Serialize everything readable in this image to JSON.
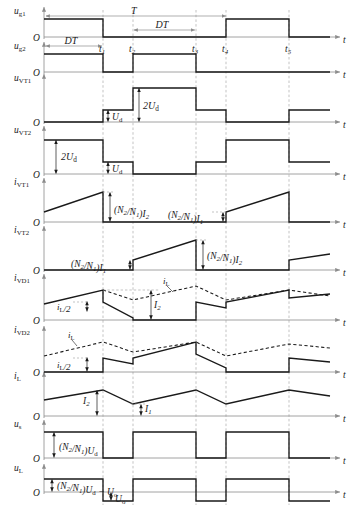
{
  "figure": {
    "type": "timing-waveform-diagram",
    "axis_label_t": "t",
    "origin_label": "O",
    "period_label": "T",
    "duty_label": "DT",
    "time_markers": [
      "t1",
      "t2",
      "t3",
      "t4",
      "t5"
    ],
    "time_marker_text": [
      "t",
      "t",
      "t",
      "t",
      "t"
    ],
    "time_marker_sub": [
      "1",
      "2",
      "3",
      "4",
      "5"
    ]
  },
  "colors": {
    "waveform": "#1a1a1a",
    "axis": "#8c8c8c",
    "dashed_guide": "#9a9a9a",
    "annotation": "#1a1a1a",
    "background": "#ffffff"
  },
  "rows": [
    {
      "id": "u_g1",
      "name": "u-g1",
      "y_label_main": "u",
      "y_label_sub": "g1",
      "annotations": [
        "T",
        "DT"
      ]
    },
    {
      "id": "u_g2",
      "name": "u-g2",
      "y_label_main": "u",
      "y_label_sub": "g2",
      "annotations": [
        "DT"
      ]
    },
    {
      "id": "u_vt1",
      "name": "u-vt1",
      "y_label_main": "u",
      "y_label_sub": "VT1",
      "annotations": [
        "Ud",
        "2Ud"
      ],
      "annotation_text": [
        "U",
        "2U"
      ],
      "annotation_sub": [
        "d",
        "d"
      ]
    },
    {
      "id": "u_vt2",
      "name": "u-vt2",
      "y_label_main": "u",
      "y_label_sub": "VT2",
      "annotations": [
        "2Ud",
        "Ud"
      ]
    },
    {
      "id": "i_vt1",
      "name": "i-vt1",
      "y_label_main": "i",
      "y_label_sub": "VT1",
      "annotations": [
        "(N2/N1)I2",
        "(N2/N1)I1"
      ]
    },
    {
      "id": "i_vt2",
      "name": "i-vt2",
      "y_label_main": "i",
      "y_label_sub": "VT2",
      "annotations": [
        "(N2/N1)I1",
        "(N2/N1)I2"
      ]
    },
    {
      "id": "i_vd1",
      "name": "i-vd1",
      "y_label_main": "i",
      "y_label_sub": "VD1",
      "annotations": [
        "iL/2",
        "I2",
        "iL"
      ]
    },
    {
      "id": "i_vd2",
      "name": "i-vd2",
      "y_label_main": "i",
      "y_label_sub": "VD2",
      "annotations": [
        "iL",
        "iL/2"
      ]
    },
    {
      "id": "i_l",
      "name": "i-l",
      "y_label_main": "i",
      "y_label_sub": "L",
      "annotations": [
        "I2",
        "I1"
      ]
    },
    {
      "id": "u_s",
      "name": "u-s",
      "y_label_main": "u",
      "y_label_sub": "s",
      "annotations": [
        "(N2/N1)Ud"
      ]
    },
    {
      "id": "u_l",
      "name": "u-l",
      "y_label_main": "u",
      "y_label_sub": "L",
      "annotations": [
        "(N2/N1)Ud - Uo",
        "Uo"
      ]
    }
  ],
  "labels": {
    "T": "T",
    "DT": "DT",
    "Ud": "U",
    "Ud_sub": "d",
    "twoUd": "2U",
    "twoUd_sub": "d",
    "N2N1": "(N",
    "N2N1_b": "/N",
    "N2N1_c": ")",
    "sub2": "2",
    "sub1": "1",
    "I1": "I",
    "I2": "I",
    "iL": "i",
    "iL_sub": "L",
    "iL_half": "/2",
    "Uo": "U",
    "Uo_sub": "o",
    "minus": "−",
    "t_axis": "t",
    "origin": "O"
  },
  "chart_data": {
    "type": "line",
    "xlabel": "t",
    "x_markers": [
      103,
      133,
      196,
      226,
      289
    ],
    "x_marker_labels": [
      "t1",
      "t2",
      "t3",
      "t4",
      "t5"
    ],
    "x_start": 44,
    "x_end": 330,
    "series": [
      {
        "name": "u_g1",
        "kind": "square",
        "high_intervals": [
          [
            44,
            103
          ],
          [
            226,
            289
          ]
        ]
      },
      {
        "name": "u_g2",
        "kind": "square",
        "high_intervals": [
          [
            44,
            103
          ],
          [
            133,
            196
          ]
        ]
      },
      {
        "name": "u_vt1",
        "kind": "multilevel",
        "levels": [
          [
            44,
            103,
            0
          ],
          [
            103,
            133,
            1
          ],
          [
            133,
            196,
            2
          ],
          [
            196,
            226,
            1
          ],
          [
            226,
            289,
            0
          ],
          [
            289,
            330,
            1
          ]
        ]
      },
      {
        "name": "u_vt2",
        "kind": "multilevel",
        "levels": [
          [
            44,
            103,
            2
          ],
          [
            103,
            133,
            1
          ],
          [
            133,
            196,
            0
          ],
          [
            196,
            226,
            1
          ],
          [
            226,
            289,
            2
          ],
          [
            289,
            330,
            1
          ]
        ]
      },
      {
        "name": "i_vt1",
        "kind": "ramp-pulse",
        "on_intervals": [
          [
            44,
            103
          ],
          [
            226,
            289
          ]
        ]
      },
      {
        "name": "i_vt2",
        "kind": "ramp-pulse",
        "on_intervals": [
          [
            133,
            196
          ],
          [
            289,
            330
          ]
        ]
      },
      {
        "name": "i_vd1",
        "kind": "diode",
        "conduct": [
          [
            44,
            103
          ]
        ]
      },
      {
        "name": "i_vd2",
        "kind": "diode",
        "conduct": [
          [
            133,
            196
          ]
        ]
      },
      {
        "name": "i_L",
        "kind": "triangle",
        "peaks": [
          103,
          196,
          289
        ],
        "valleys": [
          44,
          133,
          226,
          330
        ]
      },
      {
        "name": "u_s",
        "kind": "square",
        "high_intervals": [
          [
            44,
            103
          ],
          [
            133,
            196
          ],
          [
            226,
            289
          ]
        ]
      },
      {
        "name": "u_L",
        "kind": "bipolar",
        "pos_intervals": [
          [
            44,
            103
          ],
          [
            133,
            196
          ],
          [
            226,
            289
          ]
        ]
      }
    ]
  }
}
